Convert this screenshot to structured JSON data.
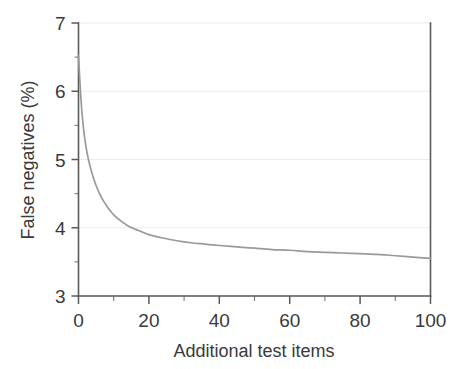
{
  "chart_data": {
    "type": "line",
    "title": "",
    "xlabel": "Additional test items",
    "ylabel": "False negatives (%)",
    "xlim": [
      0,
      100
    ],
    "ylim": [
      3,
      7
    ],
    "grid": true,
    "grid_axis": "y",
    "legend": null,
    "legend_position": "none",
    "x_ticks": [
      0,
      20,
      40,
      60,
      80,
      100
    ],
    "x_tick_labels": [
      "0",
      "20",
      "40",
      "60",
      "80",
      "100"
    ],
    "x_minor_ticks": [
      10,
      30,
      50,
      70,
      90
    ],
    "y_ticks": [
      3,
      4,
      5,
      6,
      7
    ],
    "y_tick_labels": [
      "3",
      "4",
      "5",
      "6",
      "7"
    ],
    "y_minor_ticks": [
      3.5,
      4.5,
      5.5,
      6.5
    ],
    "series": [
      {
        "name": "False negatives",
        "color": "#9a9a9a",
        "x": [
          0,
          0.5,
          1,
          1.5,
          2,
          2.5,
          3,
          4,
          5,
          6,
          7,
          8,
          9,
          10,
          12,
          14,
          16,
          18,
          20,
          24,
          28,
          32,
          36,
          40,
          45,
          50,
          55,
          60,
          65,
          70,
          75,
          80,
          85,
          90,
          95,
          100
        ],
        "y": [
          6.52,
          6.05,
          5.68,
          5.42,
          5.23,
          5.08,
          4.96,
          4.77,
          4.62,
          4.5,
          4.4,
          4.32,
          4.25,
          4.19,
          4.1,
          4.03,
          3.98,
          3.94,
          3.9,
          3.85,
          3.81,
          3.78,
          3.76,
          3.74,
          3.72,
          3.7,
          3.68,
          3.67,
          3.65,
          3.64,
          3.63,
          3.62,
          3.61,
          3.59,
          3.57,
          3.55
        ]
      }
    ]
  },
  "axes": {
    "y_title": "False negatives (%)",
    "x_title": "Additional test items"
  }
}
